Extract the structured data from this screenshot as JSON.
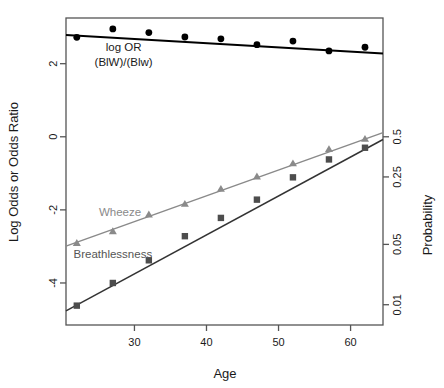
{
  "figure": {
    "background": "#ffffff",
    "frame_color": "#555555"
  },
  "chart_data": {
    "type": "scatter",
    "title": "",
    "xlabel": "Age",
    "ylabel": "Log Odds or Odds Ratio",
    "y2label": "Probability",
    "xlim": [
      20.5,
      64.5
    ],
    "ylim": [
      -5.15,
      3.25
    ],
    "grid": false,
    "legend_position": "inline-annotations",
    "x_ticks": [
      30,
      40,
      50,
      60
    ],
    "x_tick_labels": [
      "30",
      "40",
      "50",
      "60"
    ],
    "y_ticks": [
      2,
      0,
      -2,
      -4
    ],
    "y_tick_labels": [
      "2",
      "0",
      "-2",
      "-4"
    ],
    "y2_ticks": [
      0,
      -1.0986,
      -2.9444,
      -4.5951
    ],
    "y2_tick_labels": [
      "0.5",
      "0.25",
      "0.05",
      "0.01"
    ],
    "x": [
      22,
      27,
      32,
      37,
      42,
      47,
      52,
      57,
      62
    ],
    "series": [
      {
        "name": "log OR (BlW)/(Blw)",
        "marker": "circle",
        "color": "#000000",
        "line_color": "#000000",
        "values": [
          2.72,
          2.95,
          2.85,
          2.73,
          2.68,
          2.52,
          2.62,
          2.35,
          2.45
        ],
        "fit_intercept": 3.02,
        "fit_slope": -0.0115
      },
      {
        "name": "Wheeze",
        "marker": "triangle",
        "color": "#8a8a8a",
        "line_color": "#8a8a8a",
        "values": [
          -2.9,
          -2.58,
          -2.12,
          -1.83,
          -1.42,
          -1.08,
          -0.72,
          -0.33,
          -0.05
        ],
        "fit_intercept": -4.44,
        "fit_slope": 0.0706
      },
      {
        "name": "Breathlessness",
        "marker": "square",
        "color": "#4d4d4d",
        "line_color": "#333333",
        "values": [
          -4.62,
          -4.0,
          -3.38,
          -2.72,
          -2.22,
          -1.72,
          -1.11,
          -0.62,
          -0.3
        ],
        "fit_intercept": -6.95,
        "fit_slope": 0.1066
      }
    ],
    "annotations": [
      {
        "id": "logor-label-line1",
        "text": "log OR",
        "x": 28.5,
        "y": 2.47
      },
      {
        "id": "logor-label-line2",
        "text": "(BlW)/(Blw)",
        "x": 28.5,
        "y": 2.05
      },
      {
        "id": "wheeze-label",
        "text": "Wheeze",
        "x": 28.0,
        "y": -2.07
      },
      {
        "id": "breathlessness-label",
        "text": "Breathlessness",
        "x": 27.0,
        "y": -3.22
      }
    ]
  }
}
